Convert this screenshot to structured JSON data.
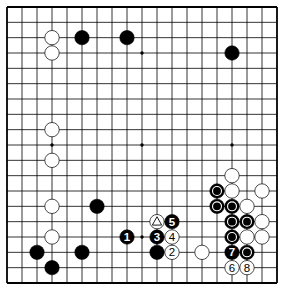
{
  "diagram": {
    "title": "Go board diagram",
    "board_size": 19,
    "colors": {
      "background": "#ffffff",
      "line": "#000000",
      "black_stone": "#000000",
      "white_stone": "#ffffff",
      "stone_outline": "#000000"
    },
    "star_points": [
      [
        3,
        3
      ],
      [
        9,
        3
      ],
      [
        15,
        3
      ],
      [
        3,
        9
      ],
      [
        9,
        9
      ],
      [
        15,
        9
      ],
      [
        3,
        15
      ],
      [
        9,
        15
      ],
      [
        15,
        15
      ]
    ],
    "stones": [
      {
        "color": "white",
        "col": 3,
        "row": 2,
        "label": "",
        "marker": ""
      },
      {
        "color": "white",
        "col": 3,
        "row": 3,
        "label": "",
        "marker": ""
      },
      {
        "color": "black",
        "col": 5,
        "row": 2,
        "label": "",
        "marker": ""
      },
      {
        "color": "black",
        "col": 8,
        "row": 2,
        "label": "",
        "marker": ""
      },
      {
        "color": "black",
        "col": 15,
        "row": 3,
        "label": "",
        "marker": ""
      },
      {
        "color": "white",
        "col": 3,
        "row": 8,
        "label": "",
        "marker": ""
      },
      {
        "color": "white",
        "col": 3,
        "row": 10,
        "label": "",
        "marker": ""
      },
      {
        "color": "white",
        "col": 3,
        "row": 13,
        "label": "",
        "marker": ""
      },
      {
        "color": "black",
        "col": 6,
        "row": 13,
        "label": "",
        "marker": ""
      },
      {
        "color": "white",
        "col": 3,
        "row": 15,
        "label": "",
        "marker": ""
      },
      {
        "color": "black",
        "col": 2,
        "row": 16,
        "label": "",
        "marker": ""
      },
      {
        "color": "black",
        "col": 5,
        "row": 16,
        "label": "",
        "marker": ""
      },
      {
        "color": "black",
        "col": 3,
        "row": 17,
        "label": "",
        "marker": ""
      },
      {
        "color": "white",
        "col": 10,
        "row": 14,
        "label": "",
        "marker": "triangle"
      },
      {
        "color": "black",
        "col": 11,
        "row": 14,
        "label": "5",
        "marker": ""
      },
      {
        "color": "black",
        "col": 8,
        "row": 15,
        "label": "1",
        "marker": ""
      },
      {
        "color": "black",
        "col": 10,
        "row": 15,
        "label": "3",
        "marker": ""
      },
      {
        "color": "white",
        "col": 11,
        "row": 15,
        "label": "4",
        "marker": ""
      },
      {
        "color": "black",
        "col": 10,
        "row": 16,
        "label": "",
        "marker": ""
      },
      {
        "color": "white",
        "col": 11,
        "row": 16,
        "label": "2",
        "marker": ""
      },
      {
        "color": "white",
        "col": 13,
        "row": 16,
        "label": "",
        "marker": ""
      },
      {
        "color": "white",
        "col": 15,
        "row": 11,
        "label": "",
        "marker": ""
      },
      {
        "color": "black",
        "col": 14,
        "row": 12,
        "label": "",
        "marker": "circle"
      },
      {
        "color": "white",
        "col": 15,
        "row": 12,
        "label": "",
        "marker": ""
      },
      {
        "color": "white",
        "col": 17,
        "row": 12,
        "label": "",
        "marker": ""
      },
      {
        "color": "black",
        "col": 14,
        "row": 13,
        "label": "",
        "marker": "circle"
      },
      {
        "color": "black",
        "col": 15,
        "row": 13,
        "label": "",
        "marker": "circle"
      },
      {
        "color": "white",
        "col": 16,
        "row": 13,
        "label": "",
        "marker": ""
      },
      {
        "color": "black",
        "col": 15,
        "row": 14,
        "label": "",
        "marker": "circle"
      },
      {
        "color": "black",
        "col": 16,
        "row": 14,
        "label": "",
        "marker": "circle"
      },
      {
        "color": "white",
        "col": 17,
        "row": 14,
        "label": "",
        "marker": ""
      },
      {
        "color": "black",
        "col": 15,
        "row": 15,
        "label": "",
        "marker": "circle"
      },
      {
        "color": "white",
        "col": 16,
        "row": 15,
        "label": "",
        "marker": ""
      },
      {
        "color": "white",
        "col": 17,
        "row": 15,
        "label": "",
        "marker": ""
      },
      {
        "color": "black",
        "col": 15,
        "row": 16,
        "label": "7",
        "marker": ""
      },
      {
        "color": "black",
        "col": 16,
        "row": 16,
        "label": "",
        "marker": "circle"
      },
      {
        "color": "white",
        "col": 15,
        "row": 17,
        "label": "6",
        "marker": ""
      },
      {
        "color": "white",
        "col": 16,
        "row": 17,
        "label": "8",
        "marker": ""
      }
    ]
  }
}
